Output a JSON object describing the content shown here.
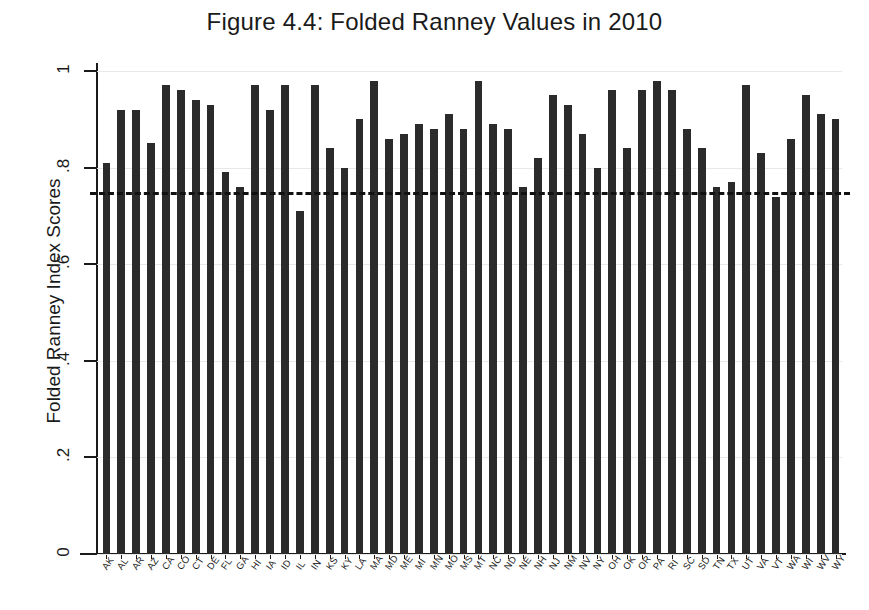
{
  "figure": {
    "title": "Figure 4.4: Folded Ranney Values in 2010",
    "y_axis_title": "Folded Ranney Index Scores"
  },
  "axis": {
    "y_ticks": [
      "0",
      ".2",
      ".4",
      ".6",
      ".8",
      "1"
    ],
    "y_tick_values": [
      0,
      0.2,
      0.4,
      0.6,
      0.8,
      1
    ]
  },
  "chart_data": {
    "type": "bar",
    "title": "Figure 4.4: Folded Ranney Values in 2010",
    "xlabel": "",
    "ylabel": "Folded Ranney Index Scores",
    "ylim": [
      0,
      1
    ],
    "yticks": [
      0,
      0.2,
      0.4,
      0.6,
      0.8,
      1
    ],
    "ytick_labels": [
      "0",
      ".2",
      ".4",
      ".6",
      ".8",
      "1"
    ],
    "grid": true,
    "legend": "none",
    "bar_color": "#2b2b2b",
    "reference_line": {
      "value": 0.75,
      "style": "dashed",
      "color": "#111111"
    },
    "categories": [
      "AK",
      "AL",
      "AR",
      "AZ",
      "CA",
      "CO",
      "CT",
      "DE",
      "FL",
      "GA",
      "HI",
      "IA",
      "ID",
      "IL",
      "IN",
      "KS",
      "KY",
      "LA",
      "MA",
      "MD",
      "ME",
      "MI",
      "MN",
      "MO",
      "MS",
      "MT",
      "NC",
      "ND",
      "NE",
      "NH",
      "NJ",
      "NM",
      "NV",
      "NY",
      "OH",
      "OK",
      "OR",
      "PA",
      "RI",
      "SC",
      "SD",
      "TN",
      "TX",
      "UT",
      "VA",
      "VT",
      "WA",
      "WI",
      "WV",
      "WY"
    ],
    "values": [
      0.81,
      0.92,
      0.92,
      0.85,
      0.97,
      0.96,
      0.94,
      0.93,
      0.79,
      0.76,
      0.97,
      0.92,
      0.97,
      0.71,
      0.97,
      0.84,
      0.8,
      0.9,
      0.98,
      0.86,
      0.87,
      0.89,
      0.88,
      0.91,
      0.88,
      0.98,
      0.89,
      0.88,
      0.76,
      0.82,
      0.95,
      0.93,
      0.87,
      0.8,
      0.96,
      0.84,
      0.96,
      0.98,
      0.96,
      0.88,
      0.84,
      0.76,
      0.77,
      0.97,
      0.83,
      0.74,
      0.86,
      0.95,
      0.91,
      0.9
    ],
    "values_tail": [
      0.76,
      0.76,
      0.8
    ]
  }
}
